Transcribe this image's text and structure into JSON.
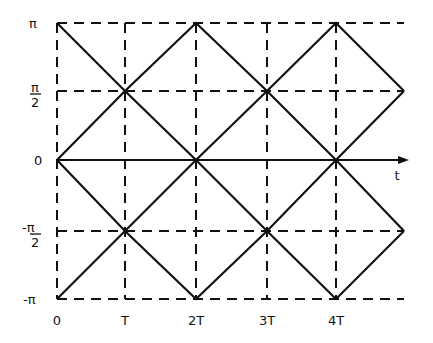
{
  "figure": {
    "type": "phase-trajectory-diagram",
    "colors": {
      "ink": "#111111",
      "background": "#ffffff"
    }
  },
  "axes": {
    "x_axis_label": "t",
    "x_ticks": [
      "0",
      "T",
      "2T",
      "3T",
      "4T"
    ],
    "y_ticks": {
      "pi": "π",
      "half_pi_num": "π",
      "half_pi_den": "2",
      "zero": "0",
      "neg_half_pi_num": "-π",
      "neg_half_pi_den": "2",
      "neg_pi": "-π"
    }
  },
  "grid": {
    "x_positions_T": [
      0,
      1,
      2,
      3,
      4
    ],
    "y_levels": [
      "π",
      "π/2",
      "0",
      "-π/2",
      "-π"
    ],
    "style": "dashed"
  },
  "trajectories": [
    {
      "name": "upper-zigzag-a",
      "points_T_phase": [
        [
          0,
          "π"
        ],
        [
          1,
          "π/2"
        ],
        [
          2,
          "0"
        ],
        [
          3,
          "π/2"
        ],
        [
          4,
          "π"
        ],
        [
          5,
          "π/2"
        ]
      ]
    },
    {
      "name": "upper-zigzag-b",
      "points_T_phase": [
        [
          0,
          "0"
        ],
        [
          1,
          "π/2"
        ],
        [
          2,
          "π"
        ],
        [
          3,
          "π/2"
        ],
        [
          4,
          "0"
        ],
        [
          5,
          "π/2"
        ]
      ]
    },
    {
      "name": "lower-zigzag-a",
      "points_T_phase": [
        [
          0,
          "0"
        ],
        [
          1,
          "-π/2"
        ],
        [
          2,
          "-π"
        ],
        [
          3,
          "-π/2"
        ],
        [
          4,
          "0"
        ],
        [
          5,
          "-π/2"
        ]
      ]
    },
    {
      "name": "lower-zigzag-b",
      "points_T_phase": [
        [
          0,
          "-π"
        ],
        [
          1,
          "-π/2"
        ],
        [
          2,
          "0"
        ],
        [
          3,
          "-π/2"
        ],
        [
          4,
          "-π"
        ],
        [
          5,
          "-π/2"
        ]
      ]
    }
  ]
}
